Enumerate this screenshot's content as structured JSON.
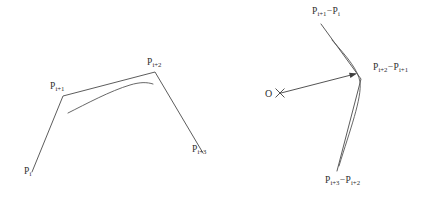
{
  "figure": {
    "caption": "",
    "background_color": "#ffffff",
    "ink_color": "#4a4a4a",
    "width": 432,
    "height": 201
  },
  "left_panel": {
    "name": "control-polygon-and-curve",
    "points": [
      {
        "id": "p-i",
        "base": "P",
        "sub": "i",
        "x": 32,
        "y": 172
      },
      {
        "id": "p-i-1",
        "base": "P",
        "sub": "i+1",
        "x": 63,
        "y": 96
      },
      {
        "id": "p-i-2",
        "base": "P",
        "sub": "i+2",
        "x": 155,
        "y": 72
      },
      {
        "id": "p-i-3",
        "base": "P",
        "sub": "i+3",
        "x": 203,
        "y": 153
      }
    ],
    "labels": [
      {
        "id": "label-p-i",
        "base": "P",
        "sub": "i",
        "text": "Pi",
        "x": 24,
        "y": 174
      },
      {
        "id": "label-p-i-1",
        "base": "P",
        "sub": "i+1",
        "text": "Pi+1",
        "x": 50,
        "y": 83
      },
      {
        "id": "label-p-i-2",
        "base": "P",
        "sub": "i+2",
        "text": "Pi+2",
        "x": 147,
        "y": 59
      },
      {
        "id": "label-p-i-3",
        "base": "P",
        "sub": "i+3",
        "text": "Pi+3",
        "x": 192,
        "y": 146
      }
    ],
    "polyline_path": "M 32 172 L 63 96 L 155 72 L 203 153",
    "curve_path": "M 68 113 C 86 104 110 91 130 85 C 140 82 147 82 153 84"
  },
  "right_panel": {
    "name": "hodograph-difference-vectors",
    "origin": {
      "id": "origin-o",
      "label": "O",
      "x": 267,
      "y": 95,
      "mark": "cross"
    },
    "labels": [
      {
        "id": "label-d-i",
        "base": "P",
        "sub": "i+1",
        "op": "−",
        "base2": "P",
        "sub2": "i",
        "x": 312,
        "y": 8
      },
      {
        "id": "label-d-i-1",
        "base": "P",
        "sub": "i+2",
        "op": "−",
        "base2": "P",
        "sub2": "i+1",
        "x": 373,
        "y": 64
      },
      {
        "id": "label-d-i-2",
        "base": "P",
        "sub": "i+3",
        "op": "−",
        "base2": "P",
        "sub2": "i+2",
        "x": 325,
        "y": 177
      }
    ],
    "polyline_path": "M 321 24 L 361 79 L 337 171",
    "curve_path": "M 332 40 C 348 58 358 70 360 82 C 362 98 350 130 339 166",
    "arrow": {
      "id": "origin-arrow",
      "path": "M 281 93 L 355 74",
      "tip_x": 357,
      "tip_y": 73.5,
      "angle": -14.5
    },
    "cross_mark": {
      "x": 280,
      "y": 93,
      "size": 4.2
    }
  }
}
